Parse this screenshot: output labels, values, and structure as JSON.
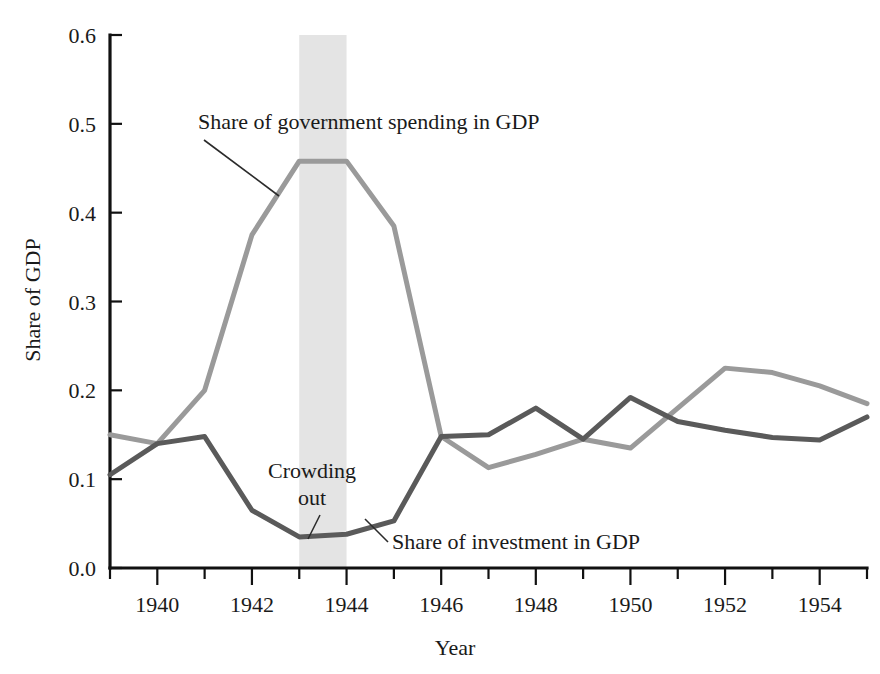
{
  "figure": {
    "background_color": "#ffffff",
    "axis_color": "#111111"
  },
  "chart_data": {
    "type": "line",
    "title": "",
    "xlabel": "Year",
    "ylabel": "Share of GDP",
    "xlim": [
      1939,
      1955
    ],
    "ylim": [
      0.0,
      0.6
    ],
    "grid": false,
    "legend_position": "inline-annotations",
    "x": [
      1939,
      1940,
      1941,
      1942,
      1943,
      1944,
      1945,
      1946,
      1947,
      1948,
      1949,
      1950,
      1951,
      1952,
      1953,
      1954,
      1955
    ],
    "xticks": [
      1939,
      1940,
      1941,
      1942,
      1943,
      1944,
      1945,
      1946,
      1947,
      1948,
      1949,
      1950,
      1951,
      1952,
      1953,
      1954,
      1955
    ],
    "xtick_labels": [
      "",
      "1940",
      "",
      "1942",
      "",
      "1944",
      "",
      "1946",
      "",
      "1948",
      "",
      "1950",
      "",
      "1952",
      "",
      "1954",
      ""
    ],
    "yticks": [
      0.0,
      0.1,
      0.2,
      0.3,
      0.4,
      0.5,
      0.6
    ],
    "ytick_labels": [
      "0.0",
      "0.1",
      "0.2",
      "0.3",
      "0.4",
      "0.5",
      "0.6"
    ],
    "series": [
      {
        "name": "Share of government spending in GDP",
        "color": "#9a9a9a",
        "line_width": 5,
        "values": [
          0.15,
          0.14,
          0.2,
          0.375,
          0.458,
          0.458,
          0.385,
          0.148,
          0.113,
          0.128,
          0.145,
          0.135,
          0.18,
          0.225,
          0.22,
          0.205,
          0.185
        ]
      },
      {
        "name": "Share of investment in GDP",
        "color": "#5a5a5a",
        "line_width": 5,
        "values": [
          0.105,
          0.14,
          0.148,
          0.065,
          0.035,
          0.038,
          0.053,
          0.148,
          0.15,
          0.18,
          0.145,
          0.192,
          0.165,
          0.155,
          0.147,
          0.144,
          0.17
        ]
      }
    ],
    "shaded_bands": [
      {
        "label": "Crowding out",
        "x_start": 1943,
        "x_end": 1944,
        "color": "#e4e4e4"
      }
    ],
    "annotations": [
      {
        "id": "gov-label",
        "text": "Share of government spending in GDP",
        "x_px": 198,
        "y_px": 129,
        "anchor": "start",
        "leader": {
          "x1": 204,
          "y1": 140,
          "x2": 279,
          "y2": 196
        }
      },
      {
        "id": "crowding-label-line1",
        "text": "Crowding",
        "x_px": 268,
        "y_px": 478,
        "anchor": "start",
        "leader": null
      },
      {
        "id": "crowding-label-line2",
        "text": "out",
        "x_px": 298,
        "y_px": 505,
        "anchor": "start",
        "leader": {
          "x1": 320,
          "y1": 515,
          "x2": 308,
          "y2": 539
        }
      },
      {
        "id": "investment-label",
        "text": "Share of investment in GDP",
        "x_px": 392,
        "y_px": 549,
        "anchor": "start",
        "leader": {
          "x1": 388,
          "y1": 542,
          "x2": 365,
          "y2": 519
        }
      }
    ]
  }
}
